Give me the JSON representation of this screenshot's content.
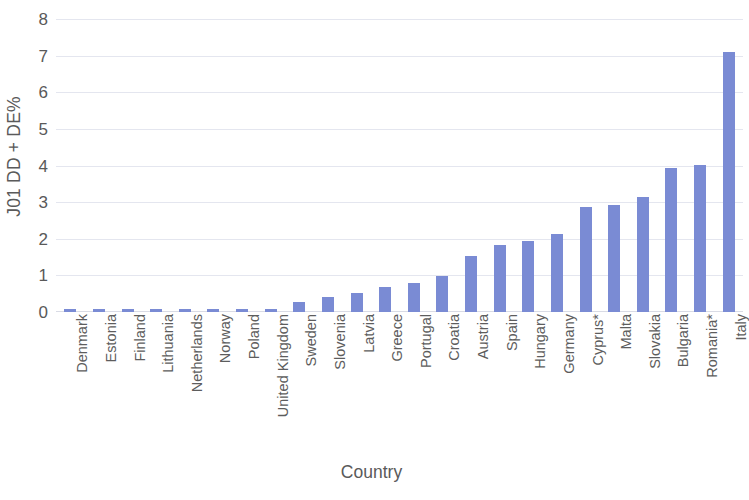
{
  "chart_data": {
    "type": "bar",
    "title": "",
    "xlabel": "Country",
    "ylabel": "J01 DD + DE%",
    "ylim": [
      0,
      8
    ],
    "ytick_labels": [
      "8",
      "7",
      "6",
      "5",
      "4",
      "3",
      "2",
      "1",
      "0"
    ],
    "yticks": [
      8,
      7,
      6,
      5,
      4,
      3,
      2,
      1,
      0
    ],
    "grid": true,
    "legend": null,
    "bar_color": "#7a8bd4",
    "categories": [
      "Denmark",
      "Estonia",
      "Finland",
      "Lithuania",
      "Netherlands",
      "Norway",
      "Poland",
      "United Kingdom",
      "Sweden",
      "Slovenia",
      "Latvia",
      "Greece",
      "Portugal",
      "Croatia",
      "Austria",
      "Spain",
      "Hungary",
      "Germany",
      "Cyprus*",
      "Malta",
      "Slovakia",
      "Bulgaria",
      "Romania*",
      "Italy"
    ],
    "values": [
      0.07,
      0.07,
      0.07,
      0.07,
      0.07,
      0.07,
      0.07,
      0.07,
      0.26,
      0.4,
      0.52,
      0.68,
      0.79,
      0.97,
      1.53,
      1.84,
      1.93,
      2.14,
      2.86,
      2.93,
      3.13,
      3.93,
      4.02,
      7.1
    ]
  }
}
